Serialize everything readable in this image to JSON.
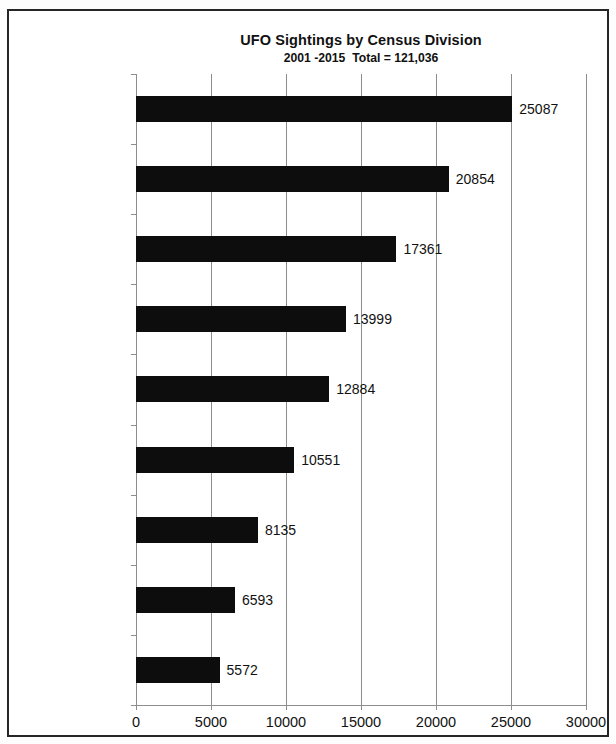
{
  "chart_data": {
    "type": "bar",
    "orientation": "horizontal",
    "title": "UFO Sightings by Census Division",
    "subtitle": "2001 -2015  Total = 121,036",
    "xlabel": "",
    "ylabel": "",
    "xlim": [
      0,
      30000
    ],
    "xticks": [
      "0",
      "5000",
      "10000",
      "15000",
      "20000",
      "25000",
      "30000"
    ],
    "xtick_values": [
      0,
      5000,
      10000,
      15000,
      20000,
      25000,
      30000
    ],
    "grid": "vertical",
    "legend": "none",
    "bar_color": "#0d0d0d",
    "categories": [
      "Pacific Division",
      "South Atlantic Division",
      "East North Central Division",
      "Mountain Division",
      "Middle Atlantic Division",
      "West South Central Division",
      "West North Central Division",
      "New England Division",
      "East South Central Division"
    ],
    "values": [
      25087,
      20854,
      17361,
      13999,
      12884,
      10551,
      8135,
      6593,
      5572
    ],
    "value_labels": [
      "25087",
      "20854",
      "17361",
      "13999",
      "12884",
      "10551",
      "8135",
      "6593",
      "5572"
    ],
    "category_label_lines": [
      [
        "Pacific Division"
      ],
      [
        "South Atlantic",
        "Division"
      ],
      [
        "East North Central",
        "Division"
      ],
      [
        "Mountain Division"
      ],
      [
        "Middle Atlantic",
        "Division"
      ],
      [
        "West South Central",
        "Division"
      ],
      [
        "West North Central",
        "Division"
      ],
      [
        "New England",
        "Division"
      ],
      [
        "East South Central",
        "Division"
      ]
    ]
  }
}
